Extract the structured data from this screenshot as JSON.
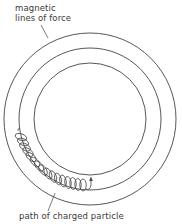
{
  "diagram": {
    "labels": {
      "field_line1": "magnetic",
      "field_line2": "lines of force",
      "particle_path": "path of charged particle"
    },
    "circles": [
      {
        "name": "outer-field-line",
        "cx": 90,
        "cy": 119,
        "r": 86
      },
      {
        "name": "middle-field-line",
        "cx": 90,
        "cy": 119,
        "r": 71
      },
      {
        "name": "inner-field-line",
        "cx": 90,
        "cy": 119,
        "r": 56
      }
    ],
    "colors": {
      "stroke": "#444444",
      "text": "#3a3a3a",
      "background": "#ffffff"
    }
  }
}
